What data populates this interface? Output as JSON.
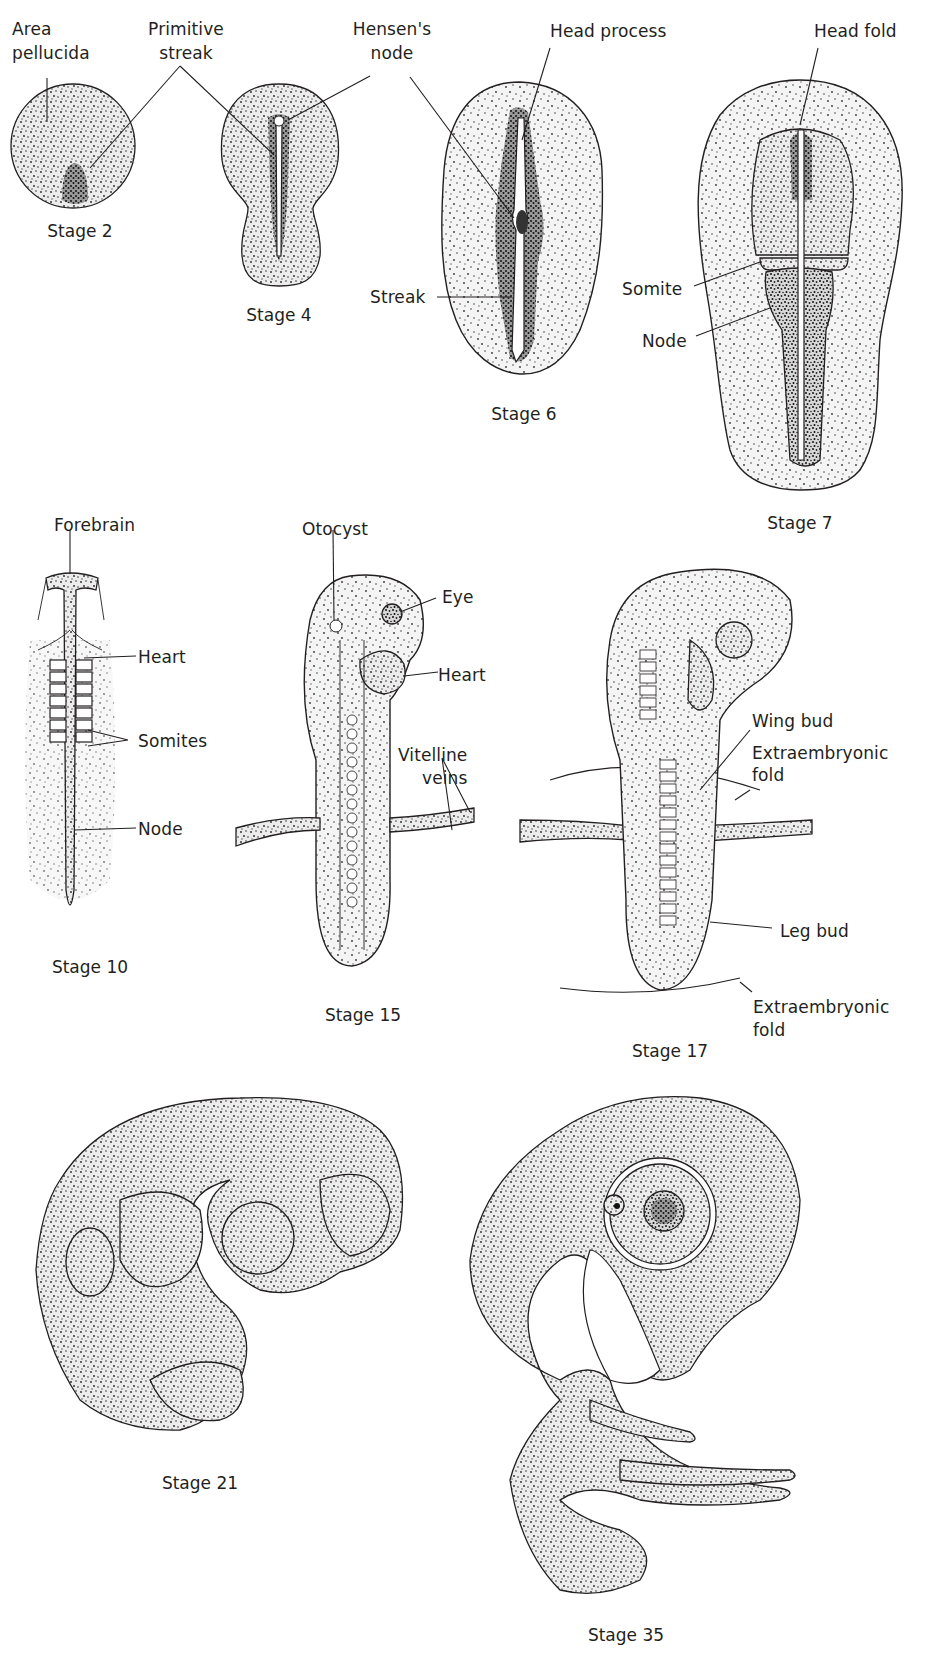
{
  "figure": {
    "stages": [
      {
        "id": "stage2",
        "caption": "Stage 2",
        "labels": {
          "area_pellucida_1": "Area",
          "area_pellucida_2": "pellucida",
          "primitive_streak_1": "Primitive",
          "primitive_streak_2": "streak"
        }
      },
      {
        "id": "stage4",
        "caption": "Stage 4",
        "labels": {
          "hensens_node_1": "Hensen's",
          "hensens_node_2": "node"
        }
      },
      {
        "id": "stage6",
        "caption": "Stage 6",
        "labels": {
          "head_process": "Head process",
          "streak": "Streak"
        }
      },
      {
        "id": "stage7",
        "caption": "Stage 7",
        "labels": {
          "head_fold": "Head fold",
          "somite": "Somite",
          "node": "Node"
        }
      },
      {
        "id": "stage10",
        "caption": "Stage 10",
        "labels": {
          "forebrain": "Forebrain",
          "heart": "Heart",
          "somites": "Somites",
          "node": "Node"
        }
      },
      {
        "id": "stage15",
        "caption": "Stage 15",
        "labels": {
          "otocyst": "Otocyst",
          "eye": "Eye",
          "heart": "Heart",
          "vitelline_veins_1": "Vitelline",
          "vitelline_veins_2": "veins"
        }
      },
      {
        "id": "stage17",
        "caption": "Stage 17",
        "labels": {
          "wing_bud": "Wing bud",
          "extraembryonic_fold_top_1": "Extraembryonic",
          "extraembryonic_fold_top_2": "fold",
          "leg_bud": "Leg bud",
          "extraembryonic_fold_bottom_1": "Extraembryonic",
          "extraembryonic_fold_bottom_2": "fold"
        }
      },
      {
        "id": "stage21",
        "caption": "Stage 21",
        "labels": {}
      },
      {
        "id": "stage35",
        "caption": "Stage 35",
        "labels": {}
      }
    ]
  },
  "colors": {
    "ink": "#231f20",
    "background": "#ffffff"
  }
}
